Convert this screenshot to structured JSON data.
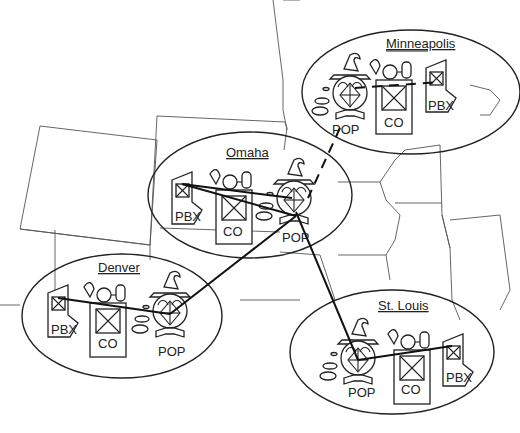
{
  "diagram": {
    "type": "network-topology-on-map",
    "sites": [
      {
        "name": "Minneapolis",
        "nodes": {
          "pop": "POP",
          "co": "CO",
          "pbx": "PBX"
        }
      },
      {
        "name": "Omaha",
        "nodes": {
          "pop": "POP",
          "co": "CO",
          "pbx": "PBX"
        }
      },
      {
        "name": "Denver",
        "nodes": {
          "pop": "POP",
          "co": "CO",
          "pbx": "PBX"
        }
      },
      {
        "name": "St. Louis",
        "nodes": {
          "pop": "POP",
          "co": "CO",
          "pbx": "PBX"
        }
      }
    ],
    "links": [
      {
        "from": "Omaha POP",
        "to": "Minneapolis POP",
        "style": "dashed"
      },
      {
        "from": "Omaha POP",
        "to": "Denver POP",
        "style": "solid"
      },
      {
        "from": "Omaha POP",
        "to": "St. Louis POP",
        "style": "solid"
      },
      {
        "from": "Minneapolis POP",
        "to": "Minneapolis PBX",
        "style": "dashed"
      }
    ],
    "colors": {
      "line": "#222222",
      "background": "#ffffff",
      "map": "#555555"
    }
  }
}
